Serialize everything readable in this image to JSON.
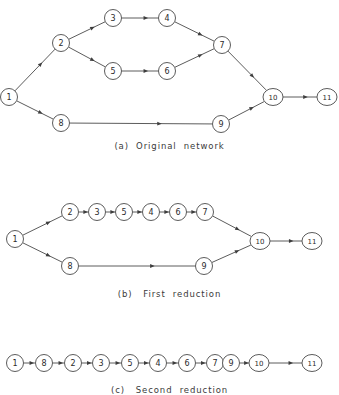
{
  "figure": {
    "background_color": "#ffffff",
    "line_color": "#4a4a4a",
    "text_color": "#2b2b2b"
  },
  "panels": [
    {
      "id": "a",
      "caption": "(a)  Original  network",
      "nodes": [
        {
          "label": "1",
          "x": 9,
          "y": 97
        },
        {
          "label": "2",
          "x": 61,
          "y": 43
        },
        {
          "label": "3",
          "x": 113,
          "y": 18
        },
        {
          "label": "4",
          "x": 167,
          "y": 18
        },
        {
          "label": "5",
          "x": 113,
          "y": 71
        },
        {
          "label": "6",
          "x": 167,
          "y": 71
        },
        {
          "label": "7",
          "x": 222,
          "y": 45
        },
        {
          "label": "8",
          "x": 61,
          "y": 123
        },
        {
          "label": "9",
          "x": 221,
          "y": 124
        },
        {
          "label": "10",
          "x": 273,
          "y": 97
        },
        {
          "label": "11",
          "x": 327,
          "y": 97
        }
      ],
      "edges": [
        {
          "from": "1",
          "to": "2"
        },
        {
          "from": "1",
          "to": "8"
        },
        {
          "from": "2",
          "to": "3"
        },
        {
          "from": "2",
          "to": "5"
        },
        {
          "from": "3",
          "to": "4"
        },
        {
          "from": "4",
          "to": "7"
        },
        {
          "from": "5",
          "to": "6"
        },
        {
          "from": "6",
          "to": "7"
        },
        {
          "from": "7",
          "to": "10"
        },
        {
          "from": "8",
          "to": "9"
        },
        {
          "from": "9",
          "to": "10"
        },
        {
          "from": "10",
          "to": "11"
        }
      ]
    },
    {
      "id": "b",
      "caption": "(b)   First  reduction",
      "nodes": [
        {
          "label": "1",
          "x": 15,
          "y": 54
        },
        {
          "label": "2",
          "x": 70,
          "y": 27
        },
        {
          "label": "3",
          "x": 97,
          "y": 27
        },
        {
          "label": "5",
          "x": 124,
          "y": 27
        },
        {
          "label": "4",
          "x": 151,
          "y": 27
        },
        {
          "label": "6",
          "x": 178,
          "y": 27
        },
        {
          "label": "7",
          "x": 205,
          "y": 27
        },
        {
          "label": "8",
          "x": 70,
          "y": 81
        },
        {
          "label": "9",
          "x": 204,
          "y": 81
        },
        {
          "label": "10",
          "x": 260,
          "y": 56
        },
        {
          "label": "11",
          "x": 312,
          "y": 56
        }
      ],
      "edges": [
        {
          "from": "1",
          "to": "2"
        },
        {
          "from": "1",
          "to": "8"
        },
        {
          "from": "2",
          "to": "3"
        },
        {
          "from": "3",
          "to": "5"
        },
        {
          "from": "5",
          "to": "4"
        },
        {
          "from": "4",
          "to": "6"
        },
        {
          "from": "6",
          "to": "7"
        },
        {
          "from": "7",
          "to": "10"
        },
        {
          "from": "8",
          "to": "9"
        },
        {
          "from": "9",
          "to": "10"
        },
        {
          "from": "10",
          "to": "11"
        }
      ]
    },
    {
      "id": "c",
      "caption": "(c)   Second  reduction",
      "nodes": [
        {
          "label": "1",
          "x": 15,
          "y": 23
        },
        {
          "label": "8",
          "x": 44,
          "y": 23
        },
        {
          "label": "2",
          "x": 73,
          "y": 23
        },
        {
          "label": "3",
          "x": 101,
          "y": 23
        },
        {
          "label": "5",
          "x": 130,
          "y": 23
        },
        {
          "label": "4",
          "x": 158,
          "y": 23
        },
        {
          "label": "6",
          "x": 187,
          "y": 23
        },
        {
          "label": "7",
          "x": 215,
          "y": 23
        },
        {
          "label": "9",
          "x": 231,
          "y": 23
        },
        {
          "label": "10",
          "x": 259,
          "y": 23
        },
        {
          "label": "11",
          "x": 312,
          "y": 23
        }
      ],
      "edges": [
        {
          "from": "1",
          "to": "8"
        },
        {
          "from": "8",
          "to": "2"
        },
        {
          "from": "2",
          "to": "3"
        },
        {
          "from": "3",
          "to": "5"
        },
        {
          "from": "5",
          "to": "4"
        },
        {
          "from": "4",
          "to": "6"
        },
        {
          "from": "6",
          "to": "7"
        },
        {
          "from": "7",
          "to": "9"
        },
        {
          "from": "9",
          "to": "10"
        },
        {
          "from": "10",
          "to": "11"
        }
      ]
    }
  ]
}
